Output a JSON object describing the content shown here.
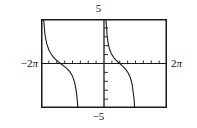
{
  "figure": {
    "kind": "graphing-calculator-plot",
    "frame": {
      "left": 41,
      "top": 19,
      "width": 126,
      "height": 89
    }
  },
  "labels": {
    "y_max": "5",
    "y_min": "−5",
    "x_min_sign": "−2",
    "x_min_symbol": "π",
    "x_max_sign": "2",
    "x_max_symbol": "π"
  },
  "chart_data": {
    "type": "line",
    "title": "",
    "subtitle": "",
    "xlabel": "",
    "ylabel": "",
    "function": "y = cot(x)",
    "xlim": [
      -6.283185307179586,
      6.283185307179586
    ],
    "ylim": [
      -5,
      5
    ],
    "xlim_label": [
      "−2π",
      "2π"
    ],
    "ylim_label": [
      "−5",
      "5"
    ],
    "grid": false,
    "legend": null,
    "legend_position": "none",
    "axes": {
      "x_axis_at_y": 0,
      "y_axis_at_x": 0,
      "x_tick_step": 0.7853981633974483,
      "y_tick_step": 1,
      "x_tick_count": 16,
      "y_tick_count": 10,
      "tick_length_px": 3,
      "show_box": true
    },
    "asymptotes_x": [
      -6.283185307179586,
      0,
      6.283185307179586
    ],
    "period": 6.283185307179586,
    "branches": [
      {
        "name": "left-branch",
        "x_range": [
          -6.283185307179586,
          0
        ],
        "description": "descending from +5 at x=-2pi to -5 approaching x=0, crossing y=0 at x=-pi"
      },
      {
        "name": "right-branch",
        "x_range": [
          0,
          6.283185307179586
        ],
        "description": "descending from +5 just right of x=0 to -5 approaching x=2pi, crossing y=0 at x=pi"
      }
    ],
    "series": [
      {
        "name": "y = cot(x)",
        "color": "#1a1a1a",
        "points_left": [
          [
            -6.2832,
            5.0
          ],
          [
            -6.2,
            5.0
          ],
          [
            -6.0,
            4.7
          ],
          [
            -5.9,
            3.4
          ],
          [
            -5.8,
            2.7
          ],
          [
            -5.7,
            2.2
          ],
          [
            -5.6,
            1.85
          ],
          [
            -5.5,
            1.55
          ],
          [
            -5.4,
            1.32
          ],
          [
            -5.3,
            1.12
          ],
          [
            -5.2,
            0.95
          ],
          [
            -5.0,
            0.67
          ],
          [
            -4.8,
            0.44
          ],
          [
            -4.6,
            0.24
          ],
          [
            -4.4,
            0.06
          ],
          [
            -4.2,
            -0.11
          ],
          [
            -4.0,
            -0.29
          ],
          [
            -3.8,
            -0.47
          ],
          [
            -3.6,
            -0.68
          ],
          [
            -3.4,
            -0.94
          ],
          [
            -3.2,
            -1.29
          ],
          [
            -3.1416,
            -1.45
          ],
          [
            -3.0,
            -1.87
          ],
          [
            -2.9,
            -2.28
          ],
          [
            -2.8,
            -2.85
          ],
          [
            -2.7,
            -3.7
          ],
          [
            -2.62,
            -4.7
          ],
          [
            -2.6,
            -5.0
          ]
        ],
        "points_right": [
          [
            0.0,
            5.0
          ],
          [
            0.08,
            5.0
          ],
          [
            0.2,
            4.93
          ],
          [
            0.3,
            3.23
          ],
          [
            0.4,
            2.37
          ],
          [
            0.5,
            1.83
          ],
          [
            0.6,
            1.46
          ],
          [
            0.7,
            1.19
          ],
          [
            0.8,
            0.97
          ],
          [
            1.0,
            0.64
          ],
          [
            1.2,
            0.39
          ],
          [
            1.4,
            0.17
          ],
          [
            1.6,
            -0.03
          ],
          [
            1.8,
            -0.23
          ],
          [
            2.0,
            -0.46
          ],
          [
            2.2,
            -0.71
          ],
          [
            2.4,
            -1.04
          ],
          [
            2.6,
            -1.51
          ],
          [
            2.8,
            -2.3
          ],
          [
            3.0,
            -4.0
          ],
          [
            3.05,
            -5.0
          ]
        ]
      }
    ]
  }
}
